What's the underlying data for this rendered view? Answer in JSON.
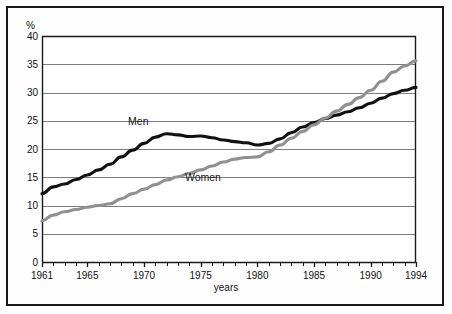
{
  "figure": {
    "frame_color": "#1a1a1a",
    "background": "#ffffff"
  },
  "chart_data": {
    "type": "line",
    "title": "",
    "xlabel": "years",
    "ylabel": "%",
    "xlim": [
      1961,
      1994
    ],
    "ylim": [
      0,
      40
    ],
    "grid": true,
    "legend_position": "inline-annotations",
    "y_ticks": [
      0,
      5,
      10,
      15,
      20,
      25,
      30,
      35,
      40
    ],
    "y_tick_labels": [
      "0",
      "5",
      "10",
      "15",
      "20",
      "25",
      "30",
      "35",
      "40"
    ],
    "x_ticks": [
      1961,
      1965,
      1970,
      1975,
      1980,
      1985,
      1990,
      1994
    ],
    "x_tick_labels": [
      "1961",
      "1965",
      "1970",
      "1975",
      "1980",
      "1985",
      "1990",
      "1994"
    ],
    "x_minor_tick_step": 1,
    "x": [
      1961,
      1962,
      1963,
      1964,
      1965,
      1966,
      1967,
      1968,
      1969,
      1970,
      1971,
      1972,
      1973,
      1974,
      1975,
      1976,
      1977,
      1978,
      1979,
      1980,
      1981,
      1982,
      1983,
      1984,
      1985,
      1986,
      1987,
      1988,
      1989,
      1990,
      1991,
      1992,
      1993,
      1994
    ],
    "series": [
      {
        "name": "Men",
        "color": "#111111",
        "label_text": "Men",
        "values": [
          12.1,
          13.3,
          13.8,
          14.6,
          15.4,
          16.3,
          17.3,
          18.6,
          19.8,
          21.0,
          22.1,
          22.7,
          22.5,
          22.2,
          22.3,
          22.0,
          21.6,
          21.3,
          21.1,
          20.7,
          21.0,
          21.8,
          22.9,
          23.9,
          24.7,
          25.4,
          26.0,
          26.6,
          27.3,
          28.1,
          29.0,
          29.8,
          30.4,
          30.9
        ]
      },
      {
        "name": "Women",
        "color": "#909090",
        "label_text": "Women",
        "values": [
          7.3,
          8.3,
          8.9,
          9.3,
          9.7,
          10.0,
          10.3,
          11.2,
          12.1,
          12.9,
          13.7,
          14.5,
          15.1,
          15.7,
          16.3,
          17.0,
          17.7,
          18.2,
          18.5,
          18.6,
          19.5,
          20.7,
          21.9,
          23.1,
          24.3,
          25.5,
          26.7,
          27.9,
          29.1,
          30.4,
          32.0,
          33.6,
          34.7,
          35.6
        ]
      }
    ],
    "annotations": [
      {
        "text": "Men",
        "x": 1969.5,
        "y": 24.2
      },
      {
        "text": "Women",
        "x": 1975.2,
        "y": 14.3
      }
    ]
  }
}
